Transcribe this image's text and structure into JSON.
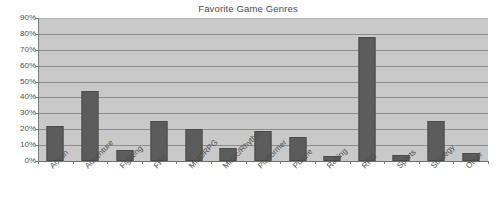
{
  "chart_data": {
    "type": "bar",
    "title": "Favorite Game Genres",
    "xlabel": "",
    "ylabel": "",
    "ylim": [
      0,
      90
    ],
    "grid": true,
    "legend": false,
    "value_suffix": "%",
    "categories": [
      "Action",
      "Adventure",
      "Fighting",
      "FPS",
      "MMORPG",
      "Music/Rhythm",
      "Platformer",
      "Puzzle",
      "Racing",
      "RPG",
      "Sports",
      "Strategy",
      "Other"
    ],
    "values": [
      22,
      44,
      7,
      25,
      20,
      8,
      19,
      15,
      3,
      78,
      4,
      25,
      5
    ],
    "ytick_labels": [
      "90%",
      "80%",
      "70%",
      "60%",
      "50%",
      "40%",
      "30%",
      "20%",
      "10%",
      "0%"
    ],
    "ytick_values": [
      90,
      80,
      70,
      60,
      50,
      40,
      30,
      20,
      10,
      0
    ],
    "colors": {
      "bar_fill": "#5c5c5c",
      "bar_edge": "#4a4a4a",
      "plot_background": "#c9c9c9",
      "gridline": "#8d8d8d",
      "axis": "#7a7a7a",
      "text": "#4d4d4d",
      "figure_background": "#ffffff"
    }
  }
}
